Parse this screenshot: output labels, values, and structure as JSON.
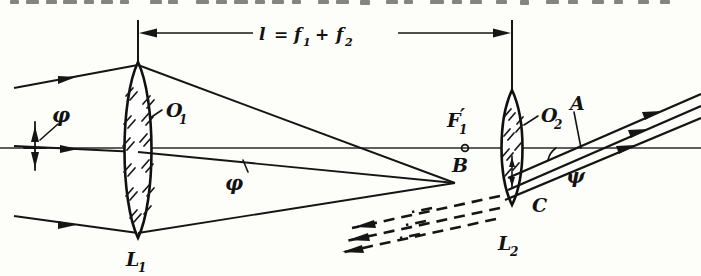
{
  "figure": {
    "name": "two-lens-beam-expander-ray-diagram",
    "background_color": "#fdfdfa",
    "ink_color": "#151515",
    "width": 701,
    "height": 276
  },
  "dimension": {
    "label_main": "l = f",
    "label_full": "l = f₁ + f₂",
    "lhs": "l",
    "equals": "=",
    "term1_base": "f",
    "term1_sub": "1",
    "plus": "+",
    "term2_base": "f",
    "term2_sub": "2",
    "left_tick_x": 138,
    "right_tick_x": 512
  },
  "labels": {
    "phi_left": "φ",
    "phi_inner": "φ",
    "psi": "ψ",
    "lens1_center": "O",
    "lens1_center_sub": "1",
    "lens1_name": "L",
    "lens1_name_sub": "1",
    "lens2_center": "O",
    "lens2_center_sub": "2",
    "lens2_name": "L",
    "lens2_name_sub": "2",
    "focal_point": "F",
    "focal_point_sub": "1",
    "focal_point_prime": "′",
    "point_b": "B",
    "point_a": "A",
    "point_c": "C"
  },
  "optics": {
    "axis_y": 148,
    "lens1": {
      "center_x": 138,
      "top_y": 62,
      "bottom_y": 238,
      "half_width": 17
    },
    "lens2": {
      "center_x": 512,
      "top_y": 90,
      "bottom_y": 205,
      "half_width": 12
    },
    "focal_point_x": 465,
    "convergence_x": 455,
    "convergence_y": 183,
    "incoming_ray_count": 3,
    "outgoing_ray_count": 3,
    "virtual_ray_count": 3
  },
  "top_text": {
    "clipped_line": "расстояние между линзами равно",
    "visible": "partially clipped descenders only"
  }
}
